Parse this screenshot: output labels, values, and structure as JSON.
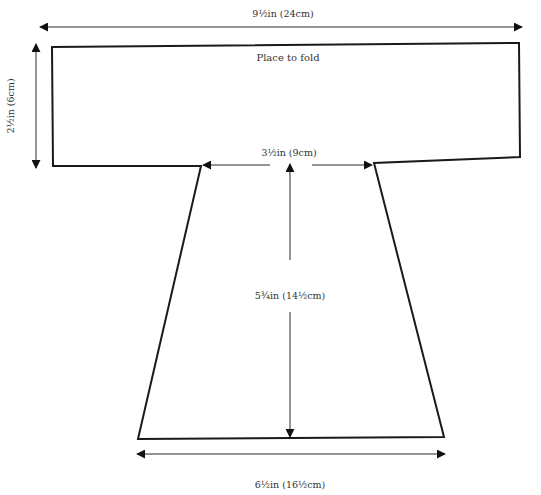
{
  "diagram": {
    "type": "sewing-pattern-piece",
    "fold_label": "Place to fold",
    "colors": {
      "outline": "#1a1a1a",
      "dimension_line": "#2a2a2a",
      "text": "#333333",
      "background": "#ffffff"
    },
    "dimensions": {
      "top_width": "9½in (24cm)",
      "top_height": "2½in (6cm)",
      "neck_width": "3½in (9cm)",
      "body_length": "5¾in (14½cm)",
      "bottom_width": "6½in (16½cm)"
    }
  }
}
